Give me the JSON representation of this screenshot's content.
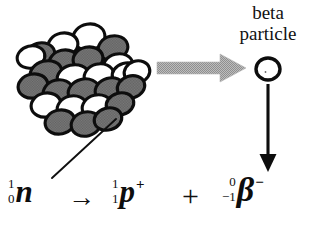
{
  "diagram": {
    "caption": {
      "line1": "beta",
      "line2": "particle"
    },
    "equation": {
      "neutron": {
        "mass_number": "1",
        "atomic_number": "0",
        "symbol": "n",
        "charge": ""
      },
      "yields_arrow": "→",
      "proton": {
        "mass_number": "1",
        "atomic_number": "1",
        "symbol": "p",
        "charge": "+"
      },
      "plus": "+",
      "beta": {
        "mass_number": "0",
        "atomic_number": "−1",
        "symbol": "β",
        "charge": "−"
      }
    },
    "colors": {
      "outline": "#0d0d0d",
      "nucleon_light": "#ffffff",
      "nucleon_dark": "#6e6e6e",
      "emission_arrow": "#a6a6a6",
      "text": "#111111",
      "background": "#ffffff"
    },
    "nucleus": {
      "label": "atomic nucleus",
      "nucleon_count": 25,
      "nucleons": [
        {
          "cx": 89,
          "cy": 37,
          "rx": 16,
          "ry": 13,
          "rot": -10,
          "fill": "light"
        },
        {
          "cx": 63,
          "cy": 45,
          "rx": 15,
          "ry": 12,
          "rot": -12,
          "fill": "light"
        },
        {
          "cx": 113,
          "cy": 48,
          "rx": 15,
          "ry": 12,
          "rot": -14,
          "fill": "dark"
        },
        {
          "cx": 40,
          "cy": 55,
          "rx": 15,
          "ry": 12,
          "rot": -16,
          "fill": "dark"
        },
        {
          "cx": 64,
          "cy": 62,
          "rx": 15,
          "ry": 12,
          "rot": -12,
          "fill": "dark"
        },
        {
          "cx": 88,
          "cy": 59,
          "rx": 15,
          "ry": 12,
          "rot": -12,
          "fill": "dark"
        },
        {
          "cx": 31,
          "cy": 57,
          "rx": 14,
          "ry": 11,
          "rot": -14,
          "fill": "light"
        },
        {
          "cx": 118,
          "cy": 66,
          "rx": 15,
          "ry": 12,
          "rot": -14,
          "fill": "light"
        },
        {
          "cx": 46,
          "cy": 73,
          "rx": 16,
          "ry": 12,
          "rot": -14,
          "fill": "dark"
        },
        {
          "cx": 73,
          "cy": 77,
          "rx": 16,
          "ry": 12,
          "rot": -14,
          "fill": "light"
        },
        {
          "cx": 99,
          "cy": 76,
          "rx": 15,
          "ry": 12,
          "rot": -14,
          "fill": "light"
        },
        {
          "cx": 126,
          "cy": 74,
          "rx": 14,
          "ry": 11,
          "rot": -16,
          "fill": "light"
        },
        {
          "cx": 137,
          "cy": 72,
          "rx": 13,
          "ry": 11,
          "rot": -18,
          "fill": "light"
        },
        {
          "cx": 33,
          "cy": 86,
          "rx": 15,
          "ry": 12,
          "rot": -12,
          "fill": "dark"
        },
        {
          "cx": 58,
          "cy": 92,
          "rx": 15,
          "ry": 12,
          "rot": -14,
          "fill": "dark"
        },
        {
          "cx": 84,
          "cy": 92,
          "rx": 16,
          "ry": 13,
          "rot": -14,
          "fill": "dark"
        },
        {
          "cx": 110,
          "cy": 90,
          "rx": 15,
          "ry": 12,
          "rot": -16,
          "fill": "dark"
        },
        {
          "cx": 131,
          "cy": 87,
          "rx": 14,
          "ry": 11,
          "rot": -18,
          "fill": "dark"
        },
        {
          "cx": 46,
          "cy": 105,
          "rx": 15,
          "ry": 12,
          "rot": -12,
          "fill": "light"
        },
        {
          "cx": 72,
          "cy": 108,
          "rx": 15,
          "ry": 12,
          "rot": -14,
          "fill": "light"
        },
        {
          "cx": 97,
          "cy": 107,
          "rx": 15,
          "ry": 12,
          "rot": -14,
          "fill": "light"
        },
        {
          "cx": 120,
          "cy": 104,
          "rx": 14,
          "ry": 11,
          "rot": -16,
          "fill": "dark"
        },
        {
          "cx": 60,
          "cy": 122,
          "rx": 15,
          "ry": 12,
          "rot": -12,
          "fill": "dark"
        },
        {
          "cx": 86,
          "cy": 124,
          "rx": 15,
          "ry": 12,
          "rot": -14,
          "fill": "dark"
        },
        {
          "cx": 108,
          "cy": 119,
          "rx": 14,
          "ry": 11,
          "rot": -16,
          "fill": "dark"
        }
      ]
    },
    "emission_arrow": {
      "label": "beta emission direction",
      "from_x": 157,
      "to_x": 246,
      "y": 68
    },
    "beta_particle": {
      "cx": 268,
      "cy": 69,
      "rx": 12,
      "ry": 11
    },
    "motion_arrow": {
      "label": "beta particle path",
      "x": 268,
      "from_y": 84,
      "to_y": 172
    },
    "pointer_line": {
      "label": "neutron pointer",
      "x1": 52,
      "y1": 178,
      "x2": 116,
      "y2": 119
    }
  }
}
